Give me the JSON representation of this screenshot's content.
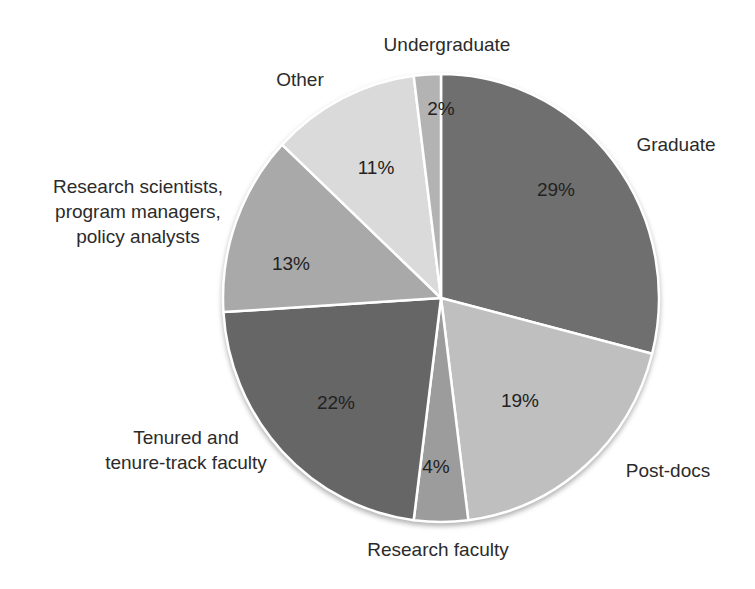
{
  "chart_data": {
    "type": "pie",
    "title": "",
    "unit": "%",
    "direction": "clockwise",
    "start_angle_deg": 0,
    "background_color": "#ffffff",
    "separator_color": "#ffffff",
    "text_color": "#2b2b2b",
    "categories": [
      "Graduate",
      "Post-docs",
      "Research faculty",
      "Tenured and tenure-track faculty",
      "Research scientists, program managers, policy analysts",
      "Other",
      "Undergraduate"
    ],
    "values": [
      29,
      19,
      4,
      22,
      13,
      11,
      2
    ],
    "slices": [
      {
        "label": "Graduate",
        "label_lines": [
          "Graduate"
        ],
        "value": 29,
        "pct_label": "29%",
        "color": "#6f6f6f"
      },
      {
        "label": "Post-docs",
        "label_lines": [
          "Post-docs"
        ],
        "value": 19,
        "pct_label": "19%",
        "color": "#bfbfbf"
      },
      {
        "label": "Research faculty",
        "label_lines": [
          "Research faculty"
        ],
        "value": 4,
        "pct_label": "4%",
        "color": "#9c9c9c"
      },
      {
        "label": "Tenured and tenure-track faculty",
        "label_lines": [
          "Tenured and",
          "tenure-track faculty"
        ],
        "value": 22,
        "pct_label": "22%",
        "color": "#666666"
      },
      {
        "label": "Research scientists, program managers, policy analysts",
        "label_lines": [
          "Research scientists,",
          "program managers,",
          "policy analysts"
        ],
        "value": 13,
        "pct_label": "13%",
        "color": "#a9a9a9"
      },
      {
        "label": "Other",
        "label_lines": [
          "Other"
        ],
        "value": 11,
        "pct_label": "11%",
        "color": "#dadada"
      },
      {
        "label": "Undergraduate",
        "label_lines": [
          "Undergraduate"
        ],
        "value": 2,
        "pct_label": "2%",
        "color": "#b3b3b3"
      }
    ]
  }
}
